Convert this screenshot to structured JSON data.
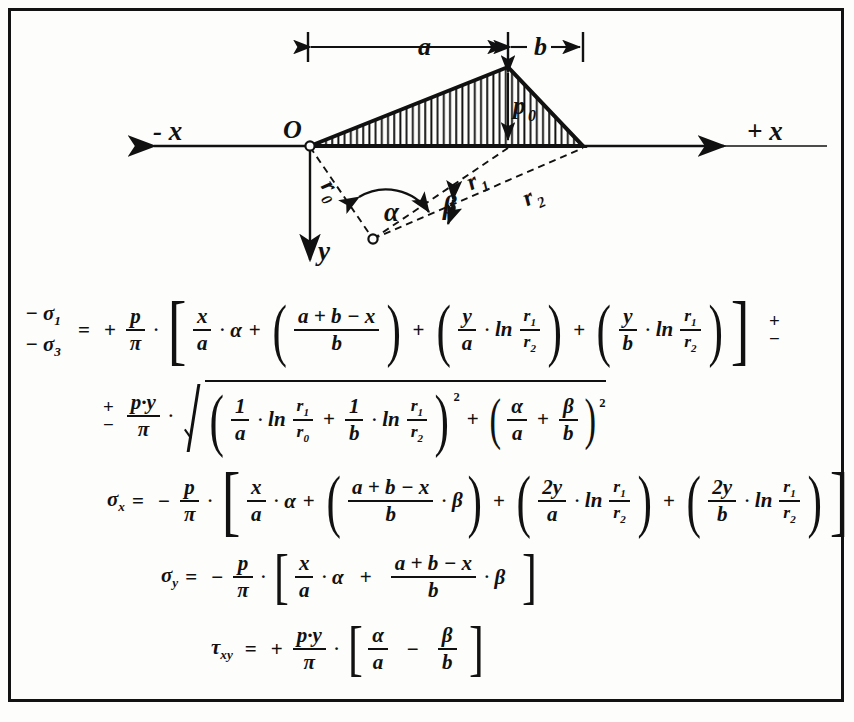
{
  "figure": {
    "diagram": {
      "axis_negative_x_label": "- x",
      "axis_positive_x_label": "+ x",
      "axis_y_label": "y",
      "origin_label": "O",
      "dimension_a_label": "a",
      "dimension_b_label": "b",
      "load_label": "p",
      "load_label_sub": "0",
      "radius_r0_label": "r",
      "radius_r0_sub": "0",
      "radius_r1_label": "r",
      "radius_r1_sub": "1",
      "radius_r2_label": "r",
      "radius_r2_sub": "2",
      "angle_alpha_label": "α",
      "angle_beta_label": "β"
    },
    "formulas": [
      {
        "id": "sigma-1-3",
        "lhs_line1": "− σ",
        "lhs_line1_sub": "1",
        "lhs_line2": "− σ",
        "lhs_line2_sub": "3",
        "equals": "=",
        "lead_sign": "+",
        "coef_num": "p",
        "coef_den": "π",
        "terms": {
          "t1_num": "x",
          "t1_den": "a",
          "t1_mult": "α",
          "t2_num": "a + b − x",
          "t2_den": "b",
          "t3_num": "y",
          "t3_den": "a",
          "t3_ln": "ln",
          "t3_ln_num": "r",
          "t3_ln_num_sub": "1",
          "t3_ln_den": "r",
          "t3_ln_den_sub": "2",
          "t4_num": "y",
          "t4_den": "b",
          "t4_ln": "ln",
          "t4_ln_num": "r",
          "t4_ln_num_sub": "1",
          "t4_ln_den": "r",
          "t4_ln_den_sub": "2"
        },
        "trailing_plus": "+",
        "trailing_minus": "−"
      },
      {
        "id": "radical-term",
        "lead_plus": "+",
        "lead_minus": "−",
        "coef_num": "p·y",
        "coef_den": "π",
        "terms": {
          "a_num": "1",
          "a_den": "a",
          "a_ln": "ln",
          "a_ln_num": "r",
          "a_ln_num_sub": "1",
          "a_ln_den": "r",
          "a_ln_den_sub": "0",
          "plus_1": "+",
          "b_num": "1",
          "b_den": "b",
          "b_ln": "ln",
          "b_ln_num": "r",
          "b_ln_num_sub": "1",
          "b_ln_den": "r",
          "b_ln_den_sub": "2",
          "pow_1": "2",
          "plus_2": "+",
          "c_num": "α",
          "c_den": "a",
          "plus_3": "+",
          "d_num": "β",
          "d_den": "b",
          "pow_2": "2"
        }
      },
      {
        "id": "sigma-x",
        "lhs": "σ",
        "lhs_sub": "x",
        "equals": "=",
        "lead_sign": "−",
        "coef_num": "p",
        "coef_den": "π",
        "terms": {
          "t1_num": "x",
          "t1_den": "a",
          "t1_mult": "α",
          "t2_num": "a + b − x",
          "t2_den": "b",
          "t2_mult": "β",
          "t3_num": "2y",
          "t3_den": "a",
          "t3_ln": "ln",
          "t3_ln_num": "r",
          "t3_ln_num_sub": "1",
          "t3_ln_den": "r",
          "t3_ln_den_sub": "2",
          "t4_num": "2y",
          "t4_den": "b",
          "t4_ln": "ln",
          "t4_ln_num": "r",
          "t4_ln_num_sub": "1",
          "t4_ln_den": "r",
          "t4_ln_den_sub": "2"
        }
      },
      {
        "id": "sigma-y",
        "lhs": "σ",
        "lhs_sub": "y",
        "equals": "=",
        "lead_sign": "−",
        "coef_num": "p",
        "coef_den": "π",
        "terms": {
          "t1_num": "x",
          "t1_den": "a",
          "t1_mult": "α",
          "plus": "+",
          "t2_num": "a + b − x",
          "t2_den": "b",
          "t2_mult": "β"
        }
      },
      {
        "id": "tau-xy",
        "lhs": "τ",
        "lhs_sub": "xy",
        "equals": "=",
        "lead_sign": "+",
        "coef_num": "p·y",
        "coef_den": "π",
        "terms": {
          "t1_num": "α",
          "t1_den": "a",
          "minus": "−",
          "t2_num": "β",
          "t2_den": "b"
        }
      }
    ],
    "symbols": {
      "dot": "·",
      "lparen": "(",
      "rparen": ")",
      "lbracket": "[",
      "rbracket": "]"
    },
    "colors": {
      "ink": "#111111",
      "paper": "#fdfdfb"
    }
  }
}
